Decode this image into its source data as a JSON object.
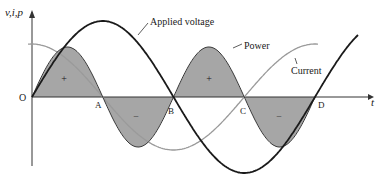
{
  "diagram": {
    "y_axis_label": "v,i,p",
    "x_axis_label": "t",
    "origin_label": "O",
    "points": [
      {
        "label": "A",
        "x": 100
      },
      {
        "label": "B",
        "x": 172
      },
      {
        "label": "C",
        "x": 246
      },
      {
        "label": "D",
        "x": 315
      }
    ],
    "curves": [
      {
        "name": "Applied voltage",
        "color": "#1a1a1a"
      },
      {
        "name": "Current",
        "color": "#9a9a9a"
      },
      {
        "name": "Power",
        "color": "#3a3a3a",
        "fill": "#a6a6a6"
      }
    ],
    "region_signs": [
      "+",
      "–",
      "+",
      "–"
    ],
    "labels": {
      "voltage": "Applied voltage",
      "power": "Power",
      "current": "Current"
    }
  }
}
